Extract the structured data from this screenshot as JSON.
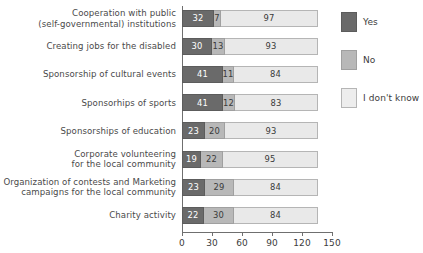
{
  "chart_data": {
    "type": "bar",
    "orientation": "horizontal",
    "stacked": true,
    "title": "",
    "xlabel": "",
    "ylabel": "",
    "xlim": [
      0,
      150
    ],
    "xticks": [
      0,
      30,
      60,
      90,
      120,
      150
    ],
    "grid": false,
    "legend_position": "right",
    "categories": [
      "Cooperation with public\n(self-governmental) institutions",
      "Creating jobs for the disabled",
      "Sponsorship of cultural events",
      "Sponsorhips of sports",
      "Sponsorships of education",
      "Corporate volunteering\nfor the local community",
      "Organization of contests and Marketing\ncampaigns for the local community",
      "Charity activity"
    ],
    "category_lines": [
      [
        "Cooperation with public",
        "(self-governmental) institutions"
      ],
      [
        "Creating jobs for the disabled"
      ],
      [
        "Sponsorship of cultural events"
      ],
      [
        "Sponsorhips of sports"
      ],
      [
        "Sponsorships of education"
      ],
      [
        "Corporate volunteering",
        "for the local community"
      ],
      [
        "Organization of contests and Marketing",
        "campaigns for the local community"
      ],
      [
        "Charity activity"
      ]
    ],
    "series": [
      {
        "name": "Yes",
        "color": "#6a6a6a",
        "values": [
          32,
          30,
          41,
          41,
          23,
          19,
          23,
          22
        ]
      },
      {
        "name": "No",
        "color": "#b8b8b8",
        "values": [
          7,
          13,
          11,
          12,
          20,
          22,
          29,
          30
        ]
      },
      {
        "name": "I don't know",
        "color": "#e9e9e9",
        "values": [
          97,
          93,
          84,
          83,
          93,
          95,
          84,
          84
        ]
      }
    ],
    "totals": [
      136,
      136,
      136,
      136,
      136,
      136,
      136,
      136
    ]
  },
  "legend": {
    "items": [
      {
        "label": "Yes",
        "color": "#6a6a6a"
      },
      {
        "label": "No",
        "color": "#b8b8b8"
      },
      {
        "label": "I don't know",
        "color": "#e9e9e9"
      }
    ]
  },
  "axis": {
    "ticks": [
      "0",
      "30",
      "60",
      "90",
      "120",
      "150"
    ]
  }
}
